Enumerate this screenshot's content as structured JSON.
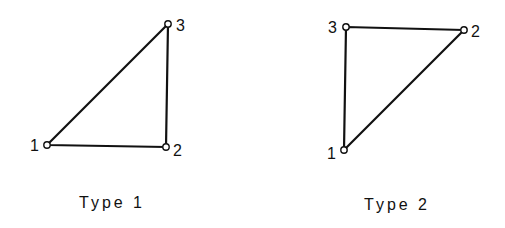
{
  "diagrams": [
    {
      "caption": "Type 1",
      "nodes": [
        {
          "label": "1",
          "x": 47,
          "y": 145
        },
        {
          "label": "2",
          "x": 166,
          "y": 147
        },
        {
          "label": "3",
          "x": 168,
          "y": 24
        }
      ],
      "edges": [
        [
          1,
          2
        ],
        [
          2,
          3
        ],
        [
          3,
          1
        ]
      ]
    },
    {
      "caption": "Type 2",
      "nodes": [
        {
          "label": "1",
          "x": 344,
          "y": 150
        },
        {
          "label": "2",
          "x": 464,
          "y": 30
        },
        {
          "label": "3",
          "x": 346,
          "y": 27
        }
      ],
      "edges": [
        [
          1,
          2
        ],
        [
          2,
          3
        ],
        [
          3,
          1
        ]
      ]
    }
  ],
  "colors": {
    "line": "#111111",
    "node_fill": "#ffffff"
  }
}
